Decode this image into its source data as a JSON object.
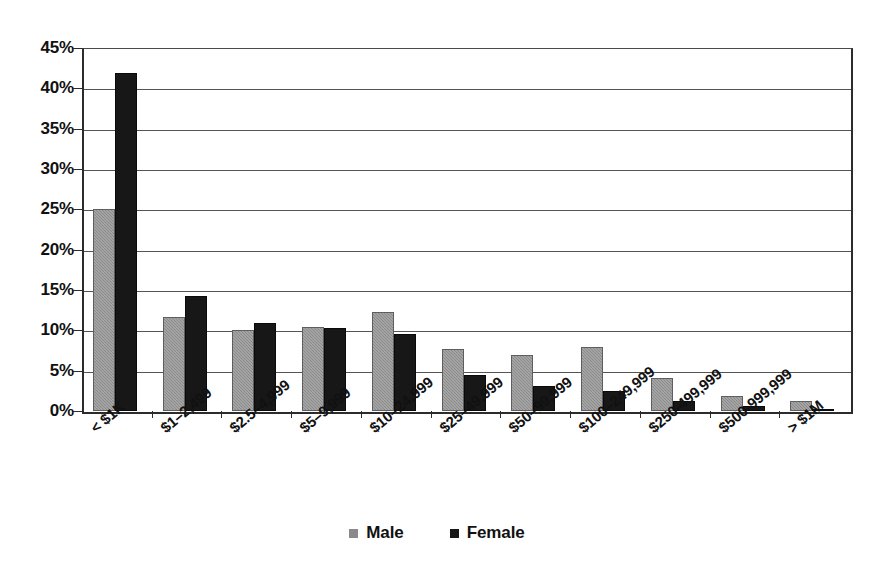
{
  "chart_data": {
    "type": "bar",
    "title": "",
    "subtitle": "",
    "xlabel": "",
    "ylabel": "",
    "ylim": [
      0,
      45
    ],
    "y_tick_step": 5,
    "y_tick_labels": [
      "45%",
      "40%",
      "35%",
      "30%",
      "25%",
      "20%",
      "15%",
      "10%",
      "5%",
      "0%"
    ],
    "y_tick_values": [
      45,
      40,
      35,
      30,
      25,
      20,
      15,
      10,
      5,
      0
    ],
    "grid": true,
    "grid_axis": "y",
    "legend_position": "bottom",
    "categories": [
      "< $1K",
      "$1–2,499",
      "$2.5–4,999",
      "$5–9,999",
      "$10–24,999",
      "$25–49,999",
      "$50–99,999",
      "$100–249,999",
      "$250-499,999",
      "$500-999,999",
      "> $1M"
    ],
    "series": [
      {
        "name": "Male",
        "color": "#8a8a8a",
        "values": [
          25.0,
          11.7,
          10.0,
          10.4,
          12.3,
          7.7,
          7.0,
          7.9,
          4.1,
          1.9,
          1.3
        ]
      },
      {
        "name": "Female",
        "color": "#171717",
        "values": [
          41.9,
          14.3,
          10.9,
          10.3,
          9.5,
          4.5,
          3.1,
          2.5,
          1.2,
          0.6,
          0.3
        ]
      }
    ]
  },
  "legend": {
    "items": [
      {
        "label": "Male",
        "swatch": "male"
      },
      {
        "label": "Female",
        "swatch": "female"
      }
    ]
  }
}
